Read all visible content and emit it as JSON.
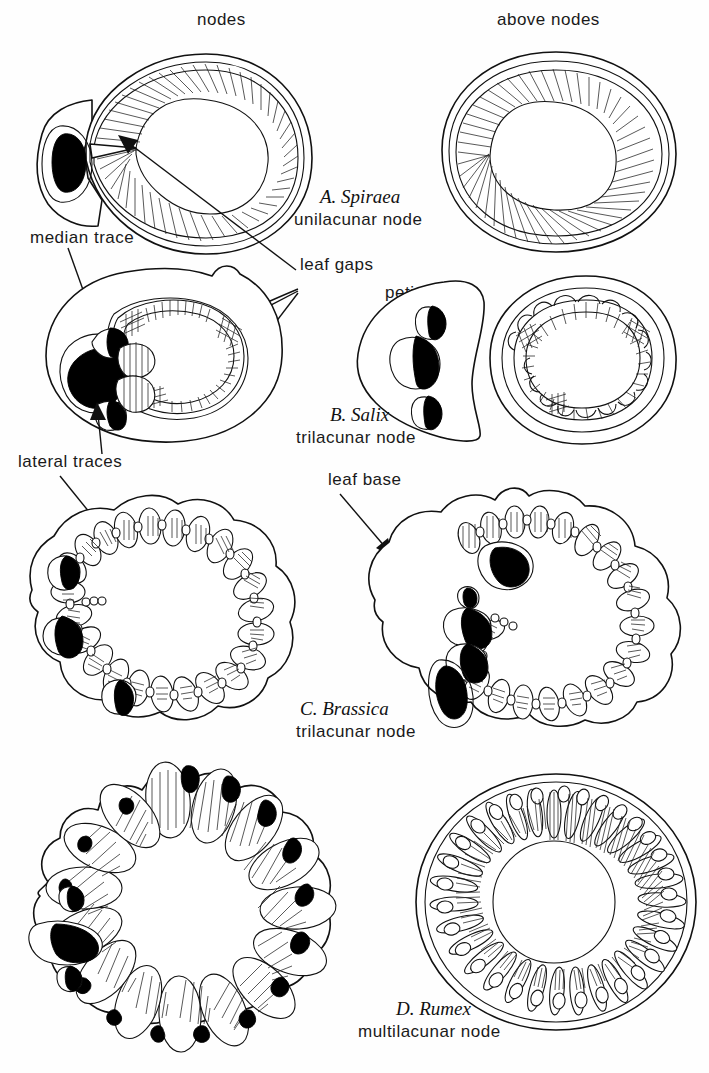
{
  "figure": {
    "title_column_labels": {
      "left": "nodes",
      "right": "above nodes"
    },
    "panels": [
      {
        "id": "A",
        "letter": "A.",
        "genus": "Spiraea",
        "caption_sci": "A. Spiraea",
        "caption_sub": "unilacunar node",
        "node_type": "unilacunar node",
        "views": [
          "nodes",
          "above nodes"
        ]
      },
      {
        "id": "B",
        "letter": "B.",
        "genus": "Salix",
        "caption_sci": "B. Salix",
        "caption_sub": "trilacunar node",
        "node_type": "trilacunar node",
        "views": [
          "nodes",
          "above nodes"
        ]
      },
      {
        "id": "C",
        "letter": "C.",
        "genus": "Brassica",
        "caption_sci": "C. Brassica",
        "caption_sub": "trilacunar node",
        "node_type": "trilacunar node",
        "views": [
          "nodes",
          "above nodes"
        ]
      },
      {
        "id": "D",
        "letter": "D.",
        "genus": "Rumex",
        "caption_sci": "D. Rumex",
        "caption_sub": "multilacunar node",
        "node_type": "multilacunar node",
        "views": [
          "nodes",
          "above nodes"
        ]
      }
    ],
    "annotations": [
      {
        "id": "median-trace",
        "text": "median trace"
      },
      {
        "id": "leaf-gaps",
        "text": "leaf gaps"
      },
      {
        "id": "petiole",
        "text": "petiole"
      },
      {
        "id": "lateral-traces",
        "text": "lateral traces"
      },
      {
        "id": "leaf-base",
        "text": "leaf base"
      }
    ],
    "colors": {
      "ink": "#111111",
      "fill": "#ffffff",
      "solid_trace": "#000000",
      "page": "#fefefe"
    }
  }
}
